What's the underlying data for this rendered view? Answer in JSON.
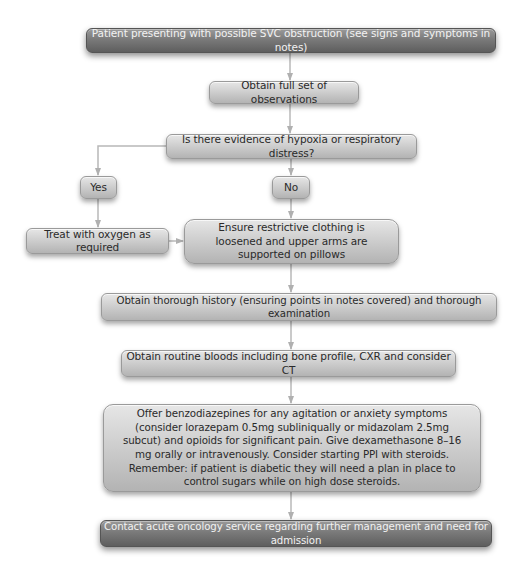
{
  "diagram": {
    "type": "flowchart",
    "colors": {
      "background": "#ffffff",
      "node_light": "#cfcfcf",
      "node_dark": "#7a7a7a",
      "connector": "#b0b0b0",
      "text_dark": "#2a2a2a",
      "text_light": "#f2f2f2"
    },
    "nodes": {
      "start": "Patient presenting with possible SVC obstruction (see signs and symptoms in notes)",
      "observations": "Obtain full set of observations",
      "question": "Is there evidence of hypoxia or respiratory distress?",
      "yes": "Yes",
      "no": "No",
      "oxygen": "Treat with oxygen as required",
      "clothing": "Ensure restrictive clothing is loosened and upper arms are supported on pillows",
      "history": "Obtain thorough history (ensuring points in notes covered) and thorough examination",
      "bloods": "Obtain routine bloods including bone profile, CXR and consider CT",
      "medication": "Offer benzodiazepines for any agitation or anxiety symptoms (consider lorazepam 0.5mg subliniqually or midazolam 2.5mg subcut) and opioids for significant pain. Give dexamethasone 8–16 mg orally or intravenously. Consider starting PPI with steroids. Remember: if patient is diabetic they will need a plan in place to control sugars while on high dose steroids.",
      "contact": "Contact acute oncology service regarding further management and need for admission"
    },
    "edges": [
      {
        "from": "start",
        "to": "observations"
      },
      {
        "from": "observations",
        "to": "question"
      },
      {
        "from": "question",
        "to": "yes"
      },
      {
        "from": "question",
        "to": "no"
      },
      {
        "from": "yes",
        "to": "oxygen"
      },
      {
        "from": "no",
        "to": "clothing"
      },
      {
        "from": "oxygen",
        "to": "clothing"
      },
      {
        "from": "clothing",
        "to": "history"
      },
      {
        "from": "history",
        "to": "bloods"
      },
      {
        "from": "bloods",
        "to": "medication"
      },
      {
        "from": "medication",
        "to": "contact"
      }
    ]
  }
}
